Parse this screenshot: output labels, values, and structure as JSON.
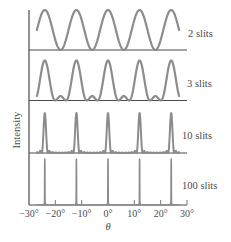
{
  "chart_data": {
    "type": "line",
    "title": "",
    "xlabel": "θ",
    "ylabel": "Intensity",
    "xlim": [
      -30,
      30
    ],
    "x_ticks": [
      -30,
      -20,
      -10,
      0,
      10,
      20,
      30
    ],
    "x_tick_labels": [
      "−30°",
      "−20°",
      "−10°",
      "0°",
      "10°",
      "20°",
      "30°"
    ],
    "grid": false,
    "legend_position": "right (inline panel labels)",
    "principal_maxima_deg": [
      -24,
      -12,
      0,
      12,
      24
    ],
    "series": [
      {
        "name": "2 slits",
        "slits": 2,
        "peak_positions": [
          -24,
          -12,
          0,
          12,
          24
        ],
        "relative_peak_height": 1.0,
        "secondary_maxima": 0,
        "peak_shape": "broad sinusoidal (cos²)"
      },
      {
        "name": "3 slits",
        "slits": 3,
        "peak_positions": [
          -24,
          -12,
          0,
          12,
          24
        ],
        "relative_peak_height": 1.0,
        "secondary_maxima": 1,
        "secondary_relative_height": 0.11,
        "peak_shape": "narrower with one small secondary maximum between principal maxima"
      },
      {
        "name": "10 slits",
        "slits": 10,
        "peak_positions": [
          -24,
          -12,
          0,
          12,
          24
        ],
        "relative_peak_height": 1.0,
        "secondary_maxima": 8,
        "peak_shape": "sharp narrow peaks, near-zero between"
      },
      {
        "name": "100 slits",
        "slits": 100,
        "peak_positions": [
          -24,
          -12,
          0,
          12,
          24
        ],
        "relative_peak_height": 1.0,
        "secondary_maxima": 98,
        "peak_shape": "very sharp line-like peaks"
      }
    ]
  },
  "panels": [
    {
      "label": "2 slits"
    },
    {
      "label": "3 slits"
    },
    {
      "label": "10 slits"
    },
    {
      "label": "100 slits"
    }
  ],
  "axes": {
    "y_label": "Intensity",
    "x_label": "θ",
    "x_tick_labels": [
      "−30°",
      "−20°",
      "−10°",
      "0°",
      "10°",
      "20°",
      "30°"
    ]
  },
  "colors": {
    "curve": "#8c8c8c",
    "axis": "#4a4a4a",
    "text": "#4a4a4a"
  }
}
